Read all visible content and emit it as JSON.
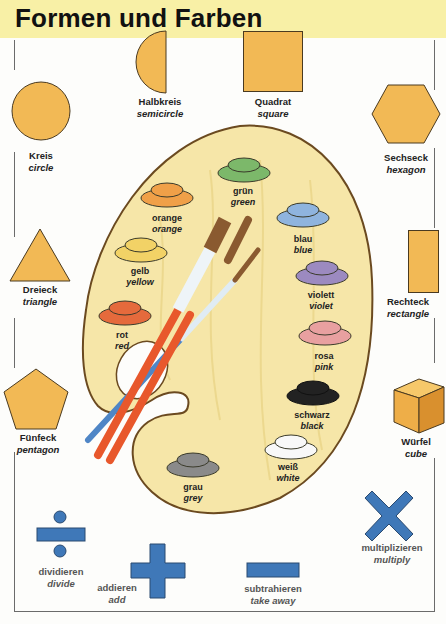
{
  "header": {
    "title": "Formen und Farben",
    "band_color": "#f8f0a6"
  },
  "colors": {
    "shape_fill": "#f2b955",
    "shape_stroke": "#4a3a20",
    "math_blue": "#3f78b8",
    "palette_wood": "#f6e6a8"
  },
  "shapes": [
    {
      "id": "circle",
      "de": "Kreis",
      "en": "circle",
      "icon": "circle-icon"
    },
    {
      "id": "semicircle",
      "de": "Halbkreis",
      "en": "semicircle",
      "icon": "semicircle-icon"
    },
    {
      "id": "square",
      "de": "Quadrat",
      "en": "square",
      "icon": "square-icon"
    },
    {
      "id": "hexagon",
      "de": "Sechseck",
      "en": "hexagon",
      "icon": "hexagon-icon"
    },
    {
      "id": "triangle",
      "de": "Dreieck",
      "en": "triangle",
      "icon": "triangle-icon"
    },
    {
      "id": "rectangle",
      "de": "Rechteck",
      "en": "rectangle",
      "icon": "rectangle-icon"
    },
    {
      "id": "pentagon",
      "de": "Fünfeck",
      "en": "pentagon",
      "icon": "pentagon-icon"
    },
    {
      "id": "cube",
      "de": "Würfel",
      "en": "cube",
      "icon": "cube-icon"
    }
  ],
  "paints": [
    {
      "de": "grün",
      "en": "green",
      "color": "#7cb86a"
    },
    {
      "de": "orange",
      "en": "orange",
      "color": "#f0a048"
    },
    {
      "de": "gelb",
      "en": "yellow",
      "color": "#f2d266"
    },
    {
      "de": "blau",
      "en": "blue",
      "color": "#8fb4de"
    },
    {
      "de": "violett",
      "en": "violet",
      "color": "#9c8ac0"
    },
    {
      "de": "rot",
      "en": "red",
      "color": "#e56a3c"
    },
    {
      "de": "rosa",
      "en": "pink",
      "color": "#e8a0a0"
    },
    {
      "de": "schwarz",
      "en": "black",
      "color": "#222222"
    },
    {
      "de": "weiß",
      "en": "white",
      "color": "#f8f8f8"
    },
    {
      "de": "grau",
      "en": "grey",
      "color": "#8a8a8a"
    }
  ],
  "math": [
    {
      "de": "dividieren",
      "en": "divide",
      "icon": "divide-icon"
    },
    {
      "de": "addieren",
      "en": "add",
      "icon": "plus-icon"
    },
    {
      "de": "subtrahieren",
      "en": "take away",
      "icon": "minus-icon"
    },
    {
      "de": "multiplizieren",
      "en": "multiply",
      "icon": "multiply-icon"
    }
  ]
}
